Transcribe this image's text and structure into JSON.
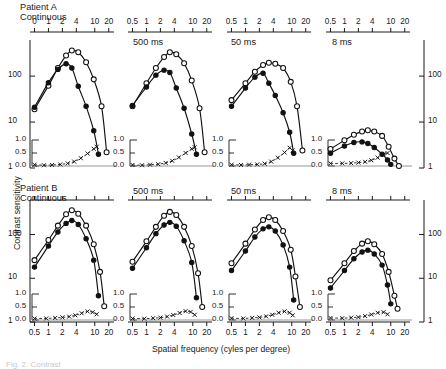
{
  "figure": {
    "y_axis_title": "Contrast sensitivity",
    "x_axis_title": "Spatial frequency (cyles per degree)",
    "caption_fragment": "Fig. 2.  Contrast"
  },
  "axes": {
    "y_ticks": [
      "100",
      "10",
      "1"
    ],
    "y_tick_values": [
      100,
      10,
      1
    ],
    "y_limits": [
      1,
      500
    ],
    "x_ticks_full": [
      "0.5",
      "1",
      "2",
      "4",
      "10",
      "20"
    ],
    "x_ticks_first_panel": [
      "0",
      "1",
      "2",
      "4",
      "10",
      "20"
    ],
    "x_tick_values": [
      0.5,
      1,
      2,
      4,
      10,
      20
    ],
    "x_limits": [
      0.4,
      26
    ],
    "inset_ticks": [
      "1.0",
      "0.5",
      "0.0"
    ],
    "inset_tick_values": [
      1.0,
      0.5,
      0.0
    ],
    "inset_limits": [
      0.0,
      1.0
    ]
  },
  "rows": [
    {
      "id": "patient-a",
      "patient_label": "Patient A",
      "first_condition": "Continuous"
    },
    {
      "id": "patient-b",
      "patient_label": "Patient B",
      "first_condition": "Continuous"
    }
  ],
  "conditions": [
    "Continuous",
    "500 ms",
    "50 ms",
    "8 ms"
  ],
  "legend": {
    "open_circle": "normal eye",
    "filled_circle": "amblyopic eye",
    "cross": "sensitivity ratio"
  },
  "chart_data": {
    "type": "line",
    "xlabel": "Spatial frequency (cyles per degree)",
    "ylabel": "Contrast sensitivity",
    "xscale": "log",
    "yscale": "log",
    "xlim": [
      0.4,
      26
    ],
    "ylim": [
      1,
      500
    ],
    "grid": false,
    "legend_position": "none",
    "inset": {
      "ylabel": "ratio",
      "ylim": [
        0.0,
        1.0
      ],
      "ticks": [
        0.0,
        0.5,
        1.0
      ]
    },
    "panels": [
      {
        "row": "Patient A",
        "condition": "Continuous",
        "series": [
          {
            "name": "open-circle",
            "marker": "open-circle",
            "x": [
              0.5,
              1,
              1.6,
              2.4,
              3.2,
              4.4,
              6.5,
              9.5,
              14,
              18
            ],
            "y": [
              19,
              62,
              150,
              280,
              360,
              330,
              200,
              85,
              22,
              2.2
            ]
          },
          {
            "name": "filled-circle",
            "marker": "filled-circle",
            "x": [
              0.5,
              1,
              1.6,
              2.4,
              3.2,
              4.4,
              6.5,
              9.5,
              12
            ],
            "y": [
              21,
              72,
              140,
              185,
              150,
              60,
              22,
              6.5,
              2.0
            ]
          },
          {
            "name": "ratio",
            "marker": "cross",
            "axis": "inset",
            "x": [
              0.5,
              0.8,
              1.2,
              1.8,
              2.6,
              3.6,
              5.0,
              7.0,
              9.5,
              11
            ],
            "y": [
              0.05,
              0.03,
              0.04,
              0.06,
              0.1,
              0.17,
              0.3,
              0.48,
              0.66,
              0.74
            ]
          }
        ]
      },
      {
        "row": "Patient A",
        "condition": "500 ms",
        "series": [
          {
            "name": "open-circle",
            "marker": "open-circle",
            "x": [
              0.5,
              1,
              1.6,
              2.4,
              3.2,
              4.4,
              6.5,
              9.5,
              14,
              18
            ],
            "y": [
              22,
              70,
              150,
              260,
              330,
              300,
              190,
              80,
              20,
              2.2
            ]
          },
          {
            "name": "filled-circle",
            "marker": "filled-circle",
            "x": [
              0.5,
              1,
              1.6,
              2.4,
              3.2,
              4.4,
              6.5,
              9.5,
              12
            ],
            "y": [
              23,
              58,
              105,
              135,
              120,
              55,
              20,
              5.5,
              2.0
            ]
          },
          {
            "name": "ratio",
            "marker": "cross",
            "axis": "inset",
            "x": [
              0.5,
              0.8,
              1.2,
              1.8,
              2.6,
              3.6,
              5.0,
              7.0,
              9.5,
              11
            ],
            "y": [
              0.04,
              0.03,
              0.05,
              0.07,
              0.12,
              0.2,
              0.33,
              0.5,
              0.66,
              0.72
            ]
          }
        ]
      },
      {
        "row": "Patient A",
        "condition": "50 ms",
        "series": [
          {
            "name": "open-circle",
            "marker": "open-circle",
            "x": [
              0.5,
              1,
              1.6,
              2.4,
              3.2,
              4.4,
              6.5,
              9.5,
              13,
              17
            ],
            "y": [
              30,
              70,
              125,
              175,
              195,
              185,
              150,
              75,
              22,
              2.4
            ]
          },
          {
            "name": "filled-circle",
            "marker": "filled-circle",
            "x": [
              0.5,
              1,
              1.6,
              2.4,
              3.2,
              4.4,
              6.5,
              9,
              11
            ],
            "y": [
              22,
              55,
              95,
              115,
              70,
              38,
              16,
              6.0,
              2.1
            ]
          },
          {
            "name": "ratio",
            "marker": "cross",
            "axis": "inset",
            "x": [
              0.5,
              0.8,
              1.2,
              1.8,
              2.6,
              3.6,
              5.0,
              7.0,
              9.0,
              10.5
            ],
            "y": [
              0.05,
              0.04,
              0.05,
              0.06,
              0.09,
              0.17,
              0.32,
              0.52,
              0.7,
              0.6
            ]
          }
        ]
      },
      {
        "row": "Patient A",
        "condition": "8 ms",
        "series": [
          {
            "name": "open-circle",
            "marker": "open-circle",
            "x": [
              0.5,
              1,
              1.6,
              2.4,
              3.2,
              4.4,
              6.5,
              9,
              12,
              15
            ],
            "y": [
              2.6,
              4.0,
              5.3,
              6.2,
              6.6,
              6.2,
              5.0,
              2.9,
              1.6,
              1.1
            ]
          },
          {
            "name": "filled-circle",
            "marker": "filled-circle",
            "x": [
              0.5,
              1,
              1.6,
              2.4,
              3.2,
              4.4,
              6.5,
              8.5,
              10
            ],
            "y": [
              2.1,
              3.0,
              3.6,
              3.7,
              3.4,
              2.8,
              2.0,
              1.5,
              1.2
            ]
          },
          {
            "name": "ratio",
            "marker": "cross",
            "axis": "inset",
            "x": [
              0.5,
              0.9,
              1.4,
              2.0,
              2.8,
              3.8,
              5.2,
              7.0,
              8.5
            ],
            "y": [
              0.1,
              0.1,
              0.11,
              0.13,
              0.16,
              0.22,
              0.32,
              0.45,
              0.5
            ]
          }
        ]
      },
      {
        "row": "Patient B",
        "condition": "Continuous",
        "series": [
          {
            "name": "open-circle",
            "marker": "open-circle",
            "x": [
              0.5,
              1,
              1.6,
              2.4,
              3.2,
              4.4,
              6.5,
              9.5,
              13,
              16
            ],
            "y": [
              26,
              75,
              160,
              290,
              360,
              300,
              160,
              60,
              14,
              2.3
            ]
          },
          {
            "name": "filled-circle",
            "marker": "filled-circle",
            "x": [
              0.5,
              1,
              1.6,
              2.4,
              3.2,
              4.4,
              6.5,
              9.5,
              12
            ],
            "y": [
              18,
              55,
              115,
              180,
              210,
              170,
              80,
              26,
              4.0
            ]
          },
          {
            "name": "ratio",
            "marker": "cross",
            "axis": "inset",
            "x": [
              0.5,
              0.9,
              1.4,
              2.0,
              2.8,
              3.8,
              5.2,
              7.0,
              9.0,
              11
            ],
            "y": [
              0.06,
              0.06,
              0.08,
              0.1,
              0.13,
              0.18,
              0.26,
              0.33,
              0.3,
              0.22
            ]
          }
        ]
      },
      {
        "row": "Patient B",
        "condition": "500 ms",
        "series": [
          {
            "name": "open-circle",
            "marker": "open-circle",
            "x": [
              0.5,
              1,
              1.6,
              2.4,
              3.2,
              4.4,
              6.5,
              9.5,
              13,
              16
            ],
            "y": [
              24,
              70,
              150,
              270,
              330,
              280,
              150,
              55,
              13,
              2.2
            ]
          },
          {
            "name": "filled-circle",
            "marker": "filled-circle",
            "x": [
              0.5,
              1,
              1.6,
              2.4,
              3.2,
              4.4,
              6.5,
              9.5,
              12
            ],
            "y": [
              17,
              50,
              105,
              165,
              190,
              155,
              72,
              23,
              3.6
            ]
          },
          {
            "name": "ratio",
            "marker": "cross",
            "axis": "inset",
            "x": [
              0.5,
              0.9,
              1.4,
              2.0,
              2.8,
              3.8,
              5.2,
              7.0,
              9.0,
              11
            ],
            "y": [
              0.06,
              0.05,
              0.07,
              0.09,
              0.13,
              0.19,
              0.27,
              0.34,
              0.31,
              0.2
            ]
          }
        ]
      },
      {
        "row": "Patient B",
        "condition": "50 ms",
        "series": [
          {
            "name": "open-circle",
            "marker": "open-circle",
            "x": [
              0.5,
              1,
              1.6,
              2.4,
              3.2,
              4.4,
              6.5,
              9.5,
              12,
              15
            ],
            "y": [
              22,
              62,
              130,
              215,
              250,
              215,
              120,
              45,
              11,
              2.2
            ]
          },
          {
            "name": "filled-circle",
            "marker": "filled-circle",
            "x": [
              0.5,
              1,
              1.6,
              2.4,
              3.2,
              4.4,
              6.5,
              9,
              11
            ],
            "y": [
              15,
              42,
              88,
              135,
              150,
              120,
              58,
              18,
              3.2
            ]
          },
          {
            "name": "ratio",
            "marker": "cross",
            "axis": "inset",
            "x": [
              0.5,
              0.9,
              1.4,
              2.0,
              2.8,
              3.8,
              5.2,
              7.0,
              9.0,
              10.5
            ],
            "y": [
              0.07,
              0.06,
              0.08,
              0.1,
              0.14,
              0.2,
              0.28,
              0.33,
              0.28,
              0.18
            ]
          }
        ]
      },
      {
        "row": "Patient B",
        "condition": "8 ms",
        "series": [
          {
            "name": "open-circle",
            "marker": "open-circle",
            "x": [
              0.5,
              1,
              1.6,
              2.4,
              3.2,
              4.4,
              6.5,
              9,
              12,
              14
            ],
            "y": [
              9,
              22,
              42,
              62,
              70,
              60,
              36,
              14,
              4.0,
              2.0
            ]
          },
          {
            "name": "filled-circle",
            "marker": "filled-circle",
            "x": [
              0.5,
              1,
              1.6,
              2.4,
              3.2,
              4.4,
              6.5,
              8.5,
              10
            ],
            "y": [
              6,
              15,
              28,
              40,
              44,
              36,
              20,
              7.0,
              2.6
            ]
          },
          {
            "name": "ratio",
            "marker": "cross",
            "axis": "inset",
            "x": [
              0.5,
              0.9,
              1.4,
              2.0,
              2.8,
              3.8,
              5.2,
              7.0,
              8.5
            ],
            "y": [
              0.08,
              0.07,
              0.09,
              0.11,
              0.15,
              0.21,
              0.28,
              0.3,
              0.22
            ]
          }
        ]
      }
    ]
  }
}
